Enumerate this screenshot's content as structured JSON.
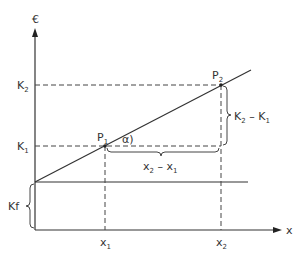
{
  "diagram": {
    "y_axis_label": "€",
    "x_axis_label": "x",
    "labels": {
      "K2": {
        "main": "K",
        "sub": "2"
      },
      "K1": {
        "main": "K",
        "sub": "1"
      },
      "Kf": "Kf",
      "x1": {
        "main": "x",
        "sub": "1"
      },
      "x2": {
        "main": "x",
        "sub": "2"
      },
      "P1": {
        "main": "P",
        "sub": "1"
      },
      "P2": {
        "main": "P",
        "sub": "2"
      },
      "alpha": "α)",
      "dK": {
        "a": "K",
        "a_sub": "2",
        "minus": " – ",
        "b": "K",
        "b_sub": "1"
      },
      "dx": {
        "a": "x",
        "a_sub": "2",
        "minus": " – ",
        "b": "x",
        "b_sub": "1"
      }
    }
  }
}
